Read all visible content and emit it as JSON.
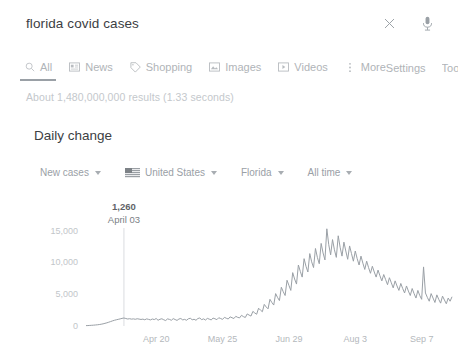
{
  "search": {
    "query": "florida covid cases",
    "placeholder": "Search",
    "clear_label": "×",
    "mic_label": "Search by voice"
  },
  "tabs": {
    "items": [
      {
        "label": "All",
        "icon": "search-icon",
        "active": true
      },
      {
        "label": "News",
        "icon": "news-icon",
        "active": false
      },
      {
        "label": "Shopping",
        "icon": "tag-icon",
        "active": false
      },
      {
        "label": "Images",
        "icon": "image-icon",
        "active": false
      },
      {
        "label": "Videos",
        "icon": "video-icon",
        "active": false
      },
      {
        "label": "More",
        "icon": "kebab-icon",
        "active": false
      }
    ],
    "settings_label": "Settings",
    "tools_label": "Tools"
  },
  "results": {
    "count_text": "About 1,480,000,000 results (1.33 seconds)"
  },
  "panel": {
    "title": "Daily change",
    "filters": [
      {
        "label": "New cases",
        "icon": "none"
      },
      {
        "label": "United States",
        "icon": "us-flag-icon"
      },
      {
        "label": "Florida",
        "icon": "none"
      },
      {
        "label": "All time",
        "icon": "none"
      }
    ]
  },
  "chart_data": {
    "type": "line",
    "title": "Daily change",
    "xlabel": "",
    "ylabel": "",
    "ylim": [
      0,
      17000
    ],
    "yticks": [
      0,
      5000,
      10000,
      15000
    ],
    "ytick_labels": [
      "0",
      "5,000",
      "10,000",
      "15,000"
    ],
    "grid": false,
    "legend": "none",
    "line_color": "#9aa0a6",
    "annotation": {
      "value": "1,260",
      "value_number": 1260,
      "date": "April 03",
      "x_index": 20
    },
    "xtick_labels": [
      "Apr 20",
      "May 25",
      "Jun 29",
      "Aug 3",
      "Sep 7"
    ],
    "xtick_indices": [
      37,
      72,
      107,
      142,
      177
    ],
    "x_start_label": "Mar 14",
    "x_end_label": "Sep 20",
    "values": [
      60,
      70,
      90,
      110,
      130,
      160,
      190,
      230,
      280,
      340,
      420,
      500,
      600,
      700,
      810,
      900,
      980,
      1050,
      1120,
      1200,
      1260,
      1180,
      1100,
      1150,
      1080,
      1120,
      1060,
      1140,
      1090,
      1030,
      1080,
      980,
      1120,
      1040,
      960,
      1100,
      1010,
      1180,
      900,
      1060,
      1140,
      980,
      860,
      1120,
      1040,
      900,
      1160,
      1020,
      880,
      1100,
      1180,
      960,
      1040,
      900,
      1140,
      1220,
      980,
      1060,
      900,
      1180,
      1260,
      1000,
      1120,
      940,
      1200,
      1080,
      960,
      1240,
      1140,
      1000,
      1300,
      1180,
      1040,
      1360,
      1220,
      1100,
      1440,
      1300,
      1180,
      1520,
      1360,
      1280,
      1680,
      1480,
      1340,
      1900,
      1720,
      1560,
      2300,
      2050,
      1850,
      2800,
      2500,
      2250,
      3400,
      3000,
      2700,
      4200,
      3700,
      3300,
      5100,
      4500,
      4000,
      6100,
      5400,
      4800,
      7200,
      6400,
      5600,
      8400,
      7400,
      6600,
      9600,
      8600,
      7700,
      10600,
      9400,
      8500,
      11400,
      10100,
      9200,
      12200,
      10800,
      9800,
      13000,
      11500,
      10400,
      15300,
      12800,
      11200,
      13600,
      12000,
      10800,
      14200,
      12400,
      11000,
      13200,
      11800,
      10500,
      12600,
      11400,
      10200,
      11800,
      10600,
      9600,
      11000,
      9900,
      8900,
      10200,
      9200,
      8300,
      9400,
      8500,
      7700,
      8800,
      7900,
      7100,
      8100,
      7300,
      6500,
      7600,
      6800,
      6000,
      7100,
      6300,
      5600,
      6700,
      5900,
      5200,
      6300,
      5500,
      4800,
      5900,
      5100,
      4400,
      5600,
      4800,
      4200,
      9300,
      5200,
      4500,
      3900,
      5100,
      4400,
      3700,
      4900,
      4200,
      3600,
      4700,
      4100,
      3500,
      4400,
      3900,
      4600
    ]
  }
}
